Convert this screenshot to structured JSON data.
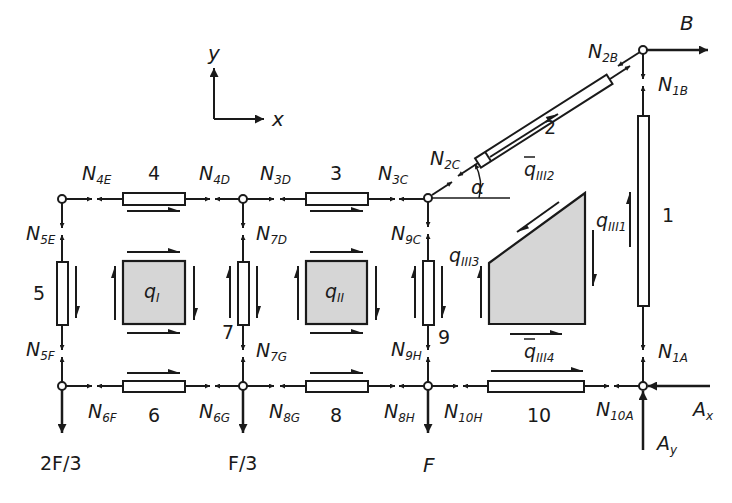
{
  "figure": {
    "axes": {
      "x_label": "x",
      "y_label": "y"
    },
    "nodes": {
      "A": "A",
      "B": "B",
      "C": "C",
      "D": "D",
      "E": "E",
      "F": "F",
      "G": "G",
      "H": "H"
    },
    "members": [
      {
        "id": "1",
        "label": "1"
      },
      {
        "id": "2",
        "label": "2"
      },
      {
        "id": "3",
        "label": "3"
      },
      {
        "id": "4",
        "label": "4"
      },
      {
        "id": "5",
        "label": "5"
      },
      {
        "id": "6",
        "label": "6"
      },
      {
        "id": "7",
        "label": "7"
      },
      {
        "id": "8",
        "label": "8"
      },
      {
        "id": "9",
        "label": "9"
      },
      {
        "id": "10",
        "label": "10"
      }
    ],
    "forces": {
      "N4E": {
        "main": "N",
        "sub": "4E"
      },
      "N4D": {
        "main": "N",
        "sub": "4D"
      },
      "N3D": {
        "main": "N",
        "sub": "3D"
      },
      "N3C": {
        "main": "N",
        "sub": "3C"
      },
      "N2C": {
        "main": "N",
        "sub": "2C"
      },
      "N2B": {
        "main": "N",
        "sub": "2B"
      },
      "N1B": {
        "main": "N",
        "sub": "1B"
      },
      "N1A": {
        "main": "N",
        "sub": "1A"
      },
      "N5E": {
        "main": "N",
        "sub": "5E"
      },
      "N5F": {
        "main": "N",
        "sub": "5F"
      },
      "N7D": {
        "main": "N",
        "sub": "7D"
      },
      "N7G": {
        "main": "N",
        "sub": "7G"
      },
      "N9C": {
        "main": "N",
        "sub": "9C"
      },
      "N9H": {
        "main": "N",
        "sub": "9H"
      },
      "N6F": {
        "main": "N",
        "sub": "6F"
      },
      "N6G": {
        "main": "N",
        "sub": "6G"
      },
      "N8G": {
        "main": "N",
        "sub": "8G"
      },
      "N8H": {
        "main": "N",
        "sub": "8H"
      },
      "N10H": {
        "main": "N",
        "sub": "10H"
      },
      "N10A": {
        "main": "N",
        "sub": "10A"
      }
    },
    "shear_flows": {
      "qI": {
        "main": "q",
        "sub": "I"
      },
      "qII": {
        "main": "q",
        "sub": "II"
      },
      "qIII1": {
        "main": "q",
        "sub": "III1"
      },
      "qIII2": {
        "main": "q",
        "sub": "III2"
      },
      "qIII3": {
        "main": "q",
        "sub": "III3"
      },
      "qIII4": {
        "main": "q",
        "sub": "III4"
      }
    },
    "loads": {
      "F_left": "2F/3",
      "F_mid": "F/3",
      "F_right": "F",
      "B": "B",
      "Ax": {
        "main": "A",
        "sub": "x"
      },
      "Ay": {
        "main": "A",
        "sub": "y"
      }
    },
    "angle_label": "α",
    "colors": {
      "ink": "#1a1a1a",
      "panel_fill": "#d6d6d6",
      "background": "#ffffff"
    }
  }
}
